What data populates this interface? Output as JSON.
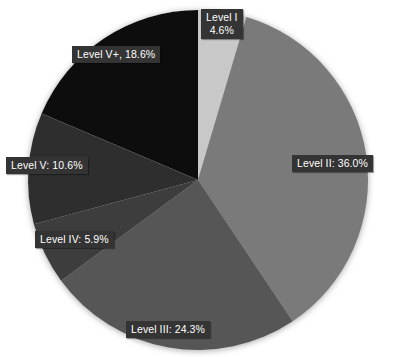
{
  "chart_data": {
    "type": "pie",
    "title": "",
    "subtitle": "",
    "xlabel": "",
    "ylabel": "",
    "legend_position": "none",
    "grid": false,
    "background_color": "#ffffff",
    "label_badge_color": "#343434",
    "label_text_color": "#ffffff",
    "start_angle_deg": 0,
    "direction": "clockwise",
    "units": "percent",
    "center": {
      "x": 198,
      "y": 180
    },
    "radius": 170,
    "categories": [
      "Level I",
      "Level II",
      "Level III",
      "Level IV",
      "Level V",
      "Level V+"
    ],
    "values": [
      4.6,
      36.0,
      24.3,
      5.9,
      10.6,
      18.6
    ],
    "colors": [
      "#c8c8c8",
      "#7a7a7a",
      "#575757",
      "#3d3d3d",
      "#2e2e2e",
      "#0a0a0a"
    ],
    "slices": [
      {
        "name": "Level I",
        "value": 4.6,
        "value_text": "4.6%",
        "label_line1": "Level I",
        "label_line2": "4.6%",
        "label_text": "Level I 4.6%",
        "two_line": true,
        "color": "#c8c8c8",
        "label_x": 201,
        "label_y": 9
      },
      {
        "name": "Level II",
        "value": 36.0,
        "value_text": "36.0%",
        "label_text": "Level II: 36.0%",
        "two_line": false,
        "color": "#7a7a7a",
        "label_x": 292,
        "label_y": 155
      },
      {
        "name": "Level III",
        "value": 24.3,
        "value_text": "24.3%",
        "label_text": "Level III: 24.3%",
        "two_line": false,
        "color": "#575757",
        "label_x": 126,
        "label_y": 321
      },
      {
        "name": "Level IV",
        "value": 5.9,
        "value_text": "5.9%",
        "label_text": "Level IV: 5.9%",
        "two_line": false,
        "color": "#3d3d3d",
        "label_x": 35,
        "label_y": 231
      },
      {
        "name": "Level V",
        "value": 10.6,
        "value_text": "10.6%",
        "label_text": "Level V: 10.6%",
        "two_line": false,
        "color": "#2e2e2e",
        "label_x": 6,
        "label_y": 157
      },
      {
        "name": "Level V+",
        "value": 18.6,
        "value_text": "18.6%",
        "label_text": "Level V+, 18.6%",
        "two_line": false,
        "color": "#0a0a0a",
        "label_x": 72,
        "label_y": 46
      }
    ]
  }
}
